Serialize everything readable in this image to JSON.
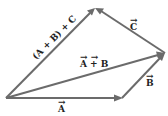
{
  "diagram": {
    "color": "#6b6b6b",
    "label_color": "#222222",
    "vectors": [
      {
        "id": "A",
        "label": "A",
        "from": "O",
        "to": "P1"
      },
      {
        "id": "B",
        "label": "B",
        "from": "P1",
        "to": "P2"
      },
      {
        "id": "AB",
        "label": "A + B",
        "from": "O",
        "to": "P2"
      },
      {
        "id": "C",
        "label": "C",
        "from": "P2",
        "to": "P3"
      },
      {
        "id": "ABC",
        "label": "(A + B) + C",
        "from": "O",
        "to": "P3"
      }
    ],
    "labels": {
      "a": "A",
      "b": "B",
      "ab": "A + B",
      "c": "C",
      "abc": "(A + B) + C"
    }
  }
}
